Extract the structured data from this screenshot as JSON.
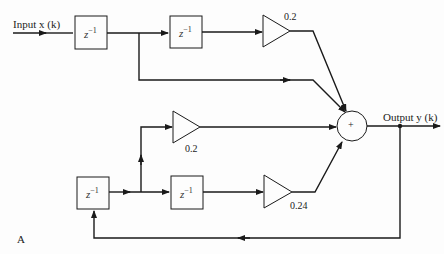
{
  "diagram": {
    "figure_label": "A",
    "input_label": "Input x (k)",
    "output_label": "Output y (k)",
    "delay_label": "z",
    "delay_exp": "−1",
    "sum_symbol": "+",
    "gains": {
      "top": "0.2",
      "middle": "0.2",
      "bottom": "0.24"
    },
    "colors": {
      "line": "#1a1a1a",
      "background": "#fdfdfd"
    }
  }
}
